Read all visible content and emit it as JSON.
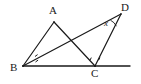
{
  "figure": {
    "kind": "geometry-diagram",
    "background_color": "#ffffff",
    "stroke_color": "#1a1a1a",
    "width": 141,
    "height": 84,
    "points": {
      "A": {
        "x": 54,
        "y": 22,
        "label": "A"
      },
      "D": {
        "x": 121,
        "y": 14,
        "label": "D"
      },
      "B": {
        "x": 23,
        "y": 66,
        "label": "B"
      },
      "C": {
        "x": 95,
        "y": 66,
        "label": "C"
      },
      "line_right_end": {
        "x": 130,
        "y": 66
      }
    },
    "segments": [
      {
        "name": "AB",
        "from": "A",
        "to": "B"
      },
      {
        "name": "AC",
        "from": "A",
        "to": "C"
      },
      {
        "name": "BD",
        "from": "B",
        "to": "D"
      },
      {
        "name": "DC",
        "from": "D",
        "to": "C"
      },
      {
        "name": "BC-baseline",
        "from": "B",
        "to": "line_right_end"
      }
    ],
    "angle_marks": [
      {
        "name": "angle-ABD-at-B-upper",
        "vertex": "B",
        "ticks": 1
      },
      {
        "name": "angle-DBC-at-B-lower",
        "vertex": "B",
        "ticks": 1
      },
      {
        "name": "angle-ACB-at-C-left",
        "vertex": "C",
        "ticks": 1
      },
      {
        "name": "angle-DCB-at-C-right",
        "vertex": "C",
        "ticks": 1
      },
      {
        "name": "angle-BDC-at-D",
        "vertex": "D",
        "ticks": 0
      }
    ],
    "labels": {
      "A": "A",
      "B": "B",
      "C": "C",
      "D": "D",
      "angle_x": "x"
    }
  }
}
